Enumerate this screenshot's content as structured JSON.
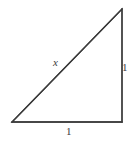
{
  "figure": {
    "type": "right-triangle-diagram",
    "background_color": "#ffffff",
    "stroke_color": "#3b3b3b",
    "stroke_width": 1.3,
    "canvas": {
      "width": 139,
      "height": 144
    },
    "vertices": {
      "bottom_left": {
        "x": 12,
        "y": 122
      },
      "bottom_right": {
        "x": 122,
        "y": 122
      },
      "top_right": {
        "x": 122,
        "y": 9
      }
    },
    "labels": {
      "hypotenuse": "x",
      "vertical_leg": "1",
      "horizontal_leg": "1"
    },
    "label_positions": {
      "hypotenuse": {
        "x": 57,
        "y": 63
      },
      "vertical_leg": {
        "x": 125,
        "y": 68
      },
      "horizontal_leg": {
        "x": 69,
        "y": 132
      }
    }
  }
}
